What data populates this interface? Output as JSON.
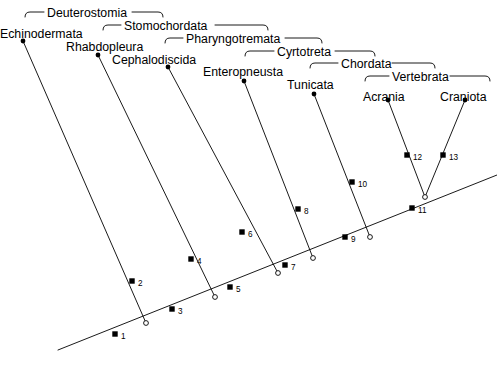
{
  "figure": {
    "type": "cladogram",
    "background_color": "#ffffff",
    "line_color": "#000000",
    "terminal_marker": "filled-dot",
    "node_marker": "open-circle",
    "apomorphy_marker": "filled-square"
  },
  "taxa": [
    {
      "id": "echinodermata",
      "label": "Echinodermata",
      "label_x": 0,
      "label_y": 28,
      "tip_x": 23,
      "tip_y": 41
    },
    {
      "id": "rhabdopleura",
      "label": "Rhabdopleura",
      "label_x": 66,
      "label_y": 41,
      "tip_x": 98,
      "tip_y": 55
    },
    {
      "id": "cephalodiscida",
      "label": "Cephalodiscida",
      "label_x": 112,
      "label_y": 54,
      "tip_x": 168,
      "tip_y": 67
    },
    {
      "id": "enteropneusta",
      "label": "Enteropneusta",
      "label_x": 203,
      "label_y": 66,
      "tip_x": 244,
      "tip_y": 81
    },
    {
      "id": "tunicata",
      "label": "Tunicata",
      "label_x": 287,
      "label_y": 79,
      "tip_x": 314,
      "tip_y": 94
    },
    {
      "id": "acrania",
      "label": "Acrania",
      "label_x": 363,
      "label_y": 91,
      "tip_x": 388,
      "tip_y": 100
    },
    {
      "id": "craniota",
      "label": "Craniota",
      "label_x": 440,
      "label_y": 91,
      "tip_x": 465,
      "tip_y": 100
    }
  ],
  "clades": [
    {
      "id": "deuterostomia",
      "label": "Deuterostomia",
      "label_x": 47,
      "label_y": 7,
      "bracket_left": 25,
      "bracket_right": 163,
      "bracket_y": 17,
      "text_gap_left": 44,
      "text_gap_right": 132
    },
    {
      "id": "stomochordata",
      "label": "Stomochordata",
      "label_x": 124,
      "label_y": 20,
      "bracket_left": 103,
      "bracket_right": 268,
      "bracket_y": 30,
      "text_gap_left": 121,
      "text_gap_right": 215
    },
    {
      "id": "pharyngotremata",
      "label": "Pharyngotremata",
      "label_x": 186,
      "label_y": 33,
      "bracket_left": 165,
      "bracket_right": 322,
      "bracket_y": 43,
      "text_gap_left": 183,
      "text_gap_right": 285
    },
    {
      "id": "cyrtotreta",
      "label": "Cyrtotreta",
      "label_x": 277,
      "label_y": 46,
      "bracket_left": 245,
      "bracket_right": 375,
      "bracket_y": 56,
      "text_gap_left": 274,
      "text_gap_right": 335
    },
    {
      "id": "chordata",
      "label": "Chordata",
      "label_x": 341,
      "label_y": 58,
      "bracket_left": 310,
      "bracket_right": 435,
      "bracket_y": 68,
      "text_gap_left": 338,
      "text_gap_right": 392
    },
    {
      "id": "vertebrata",
      "label": "Vertebrata",
      "label_x": 392,
      "label_y": 71,
      "bracket_left": 365,
      "bracket_right": 490,
      "bracket_y": 81,
      "text_gap_left": 389,
      "text_gap_right": 450
    }
  ],
  "backbone": {
    "root_x": 58,
    "root_y": 350,
    "tip_x": 497,
    "tip_y": 175
  },
  "internal_nodes": [
    {
      "id": "node-a",
      "x": 146,
      "y": 323
    },
    {
      "id": "node-b",
      "x": 215,
      "y": 297
    },
    {
      "id": "node-c",
      "x": 278,
      "y": 273
    },
    {
      "id": "node-d",
      "x": 313,
      "y": 258
    },
    {
      "id": "node-e",
      "x": 370,
      "y": 237
    },
    {
      "id": "node-f",
      "x": 425,
      "y": 197
    }
  ],
  "apomorphies": [
    {
      "number": "1",
      "x": 115,
      "y": 334,
      "label_dx": 6,
      "label_dy": -2
    },
    {
      "number": "2",
      "x": 132,
      "y": 281,
      "label_dx": 6,
      "label_dy": -2
    },
    {
      "number": "3",
      "x": 172,
      "y": 309,
      "label_dx": 6,
      "label_dy": -2
    },
    {
      "number": "4",
      "x": 191,
      "y": 259,
      "label_dx": 6,
      "label_dy": -2
    },
    {
      "number": "5",
      "x": 230,
      "y": 287,
      "label_dx": 6,
      "label_dy": -2
    },
    {
      "number": "6",
      "x": 242,
      "y": 232,
      "label_dx": 6,
      "label_dy": -2
    },
    {
      "number": "7",
      "x": 285,
      "y": 265,
      "label_dx": 6,
      "label_dy": -2
    },
    {
      "number": "8",
      "x": 298,
      "y": 209,
      "label_dx": 6,
      "label_dy": -2
    },
    {
      "number": "9",
      "x": 345,
      "y": 237,
      "label_dx": 6,
      "label_dy": -2
    },
    {
      "number": "10",
      "x": 352,
      "y": 182,
      "label_dx": 6,
      "label_dy": -2
    },
    {
      "number": "11",
      "x": 412,
      "y": 208,
      "label_dx": 6,
      "label_dy": -2
    },
    {
      "number": "12",
      "x": 407,
      "y": 155,
      "label_dx": 6,
      "label_dy": -2
    },
    {
      "number": "13",
      "x": 443,
      "y": 155,
      "label_dx": 6,
      "label_dy": -2
    }
  ],
  "caption": {
    "text": ""
  }
}
